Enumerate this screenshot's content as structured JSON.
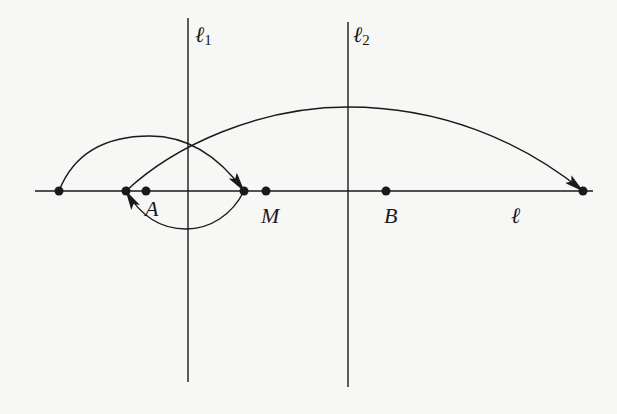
{
  "diagram": {
    "colors": {
      "ink": "#1a1a1a",
      "background": "#f7f7f5"
    },
    "lines": {
      "l": {
        "label": "ℓ",
        "y": 191,
        "x1": 35,
        "x2": 593
      },
      "l1": {
        "label": "ℓ",
        "subscript": "1",
        "x": 188,
        "y1": 18,
        "y2": 382
      },
      "l2": {
        "label": "ℓ",
        "subscript": "2",
        "x": 348,
        "y1": 22,
        "y2": 387
      }
    },
    "points": [
      {
        "id": "p0",
        "label": "",
        "x": 59,
        "y": 191
      },
      {
        "id": "p1",
        "label": "",
        "x": 126,
        "y": 191
      },
      {
        "id": "A",
        "label": "A",
        "x": 146,
        "y": 191
      },
      {
        "id": "p2",
        "label": "",
        "x": 244,
        "y": 191
      },
      {
        "id": "M",
        "label": "M",
        "x": 266,
        "y": 191
      },
      {
        "id": "B",
        "label": "B",
        "x": 386,
        "y": 191
      },
      {
        "id": "p3",
        "label": "",
        "x": 583,
        "y": 191
      }
    ],
    "arrows": [
      {
        "from": "p0",
        "to": "p2",
        "side": "above"
      },
      {
        "from": "p2",
        "to": "p1",
        "side": "below"
      },
      {
        "from": "p1",
        "to": "p3",
        "side": "above"
      }
    ]
  }
}
